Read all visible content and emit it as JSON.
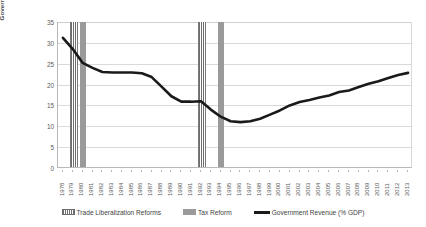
{
  "chart_data": {
    "type": "line",
    "title": "",
    "xlabel": "",
    "ylabel": "Government Revenue (% GDP)",
    "ylim": [
      0,
      35
    ],
    "ytick_step": 5,
    "yticks": [
      "0",
      "5",
      "10",
      "15",
      "20",
      "25",
      "30",
      "35"
    ],
    "grid": true,
    "legend_position": "bottom",
    "categories": [
      "1978",
      "1979",
      "1980",
      "1981",
      "1982",
      "1983",
      "1984",
      "1985",
      "1986",
      "1987",
      "1988",
      "1989",
      "1990",
      "1991",
      "1992",
      "1993",
      "1994",
      "1995",
      "1996",
      "1997",
      "1998",
      "1999",
      "2000",
      "2001",
      "2002",
      "2003",
      "2004",
      "2005",
      "2006",
      "2007",
      "2008",
      "2009",
      "2010",
      "2011",
      "2012",
      "2013"
    ],
    "series": [
      {
        "name": "Government Revenue (% GDP)",
        "color": "#1a1a1a",
        "values": [
          31.2,
          28.5,
          25.2,
          24.0,
          23.0,
          22.9,
          22.9,
          22.9,
          22.7,
          21.8,
          19.5,
          17.2,
          15.9,
          15.9,
          16.0,
          14.0,
          12.3,
          11.2,
          11.0,
          11.2,
          11.8,
          12.8,
          13.8,
          15.0,
          15.8,
          16.3,
          16.9,
          17.4,
          18.2,
          18.6,
          19.4,
          20.2,
          20.8,
          21.6,
          22.3,
          22.8
        ]
      }
    ],
    "event_markers": [
      {
        "name": "Trade Liberalization Reforms",
        "style": "hatched",
        "color": "#6e6e6e",
        "years": [
          "1979",
          "1992"
        ]
      },
      {
        "name": "Tax Reform",
        "style": "solid",
        "color": "#9a9a9a",
        "years": [
          "1980",
          "1994"
        ]
      }
    ]
  },
  "legend": {
    "items": [
      {
        "label": "Trade Liberalization Reforms",
        "swatch": "hatched-swatch"
      },
      {
        "label": "Tax Reform",
        "swatch": "solid-gray-swatch"
      },
      {
        "label": "Government Revenue (% GDP)",
        "swatch": "black-line-swatch"
      }
    ]
  }
}
